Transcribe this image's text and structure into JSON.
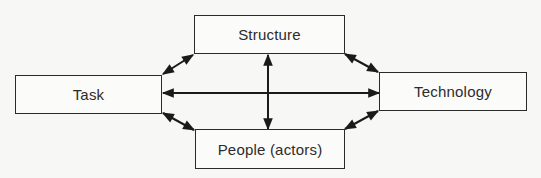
{
  "diagram": {
    "type": "system-relationship",
    "nodes": [
      {
        "id": "structure",
        "label": "Structure"
      },
      {
        "id": "task",
        "label": "Task"
      },
      {
        "id": "technology",
        "label": "Technology"
      },
      {
        "id": "people",
        "label": "People (actors)"
      }
    ],
    "edges": [
      {
        "from": "task",
        "to": "technology",
        "direction": "both"
      },
      {
        "from": "structure",
        "to": "people",
        "direction": "both"
      },
      {
        "from": "task",
        "to": "structure",
        "direction": "both"
      },
      {
        "from": "task",
        "to": "people",
        "direction": "both"
      },
      {
        "from": "structure",
        "to": "technology",
        "direction": "both"
      },
      {
        "from": "people",
        "to": "technology",
        "direction": "both"
      }
    ],
    "colors": {
      "line": "#1a1a1a",
      "background": "#f7f7f5",
      "box_fill": "#fbfbfa"
    }
  }
}
